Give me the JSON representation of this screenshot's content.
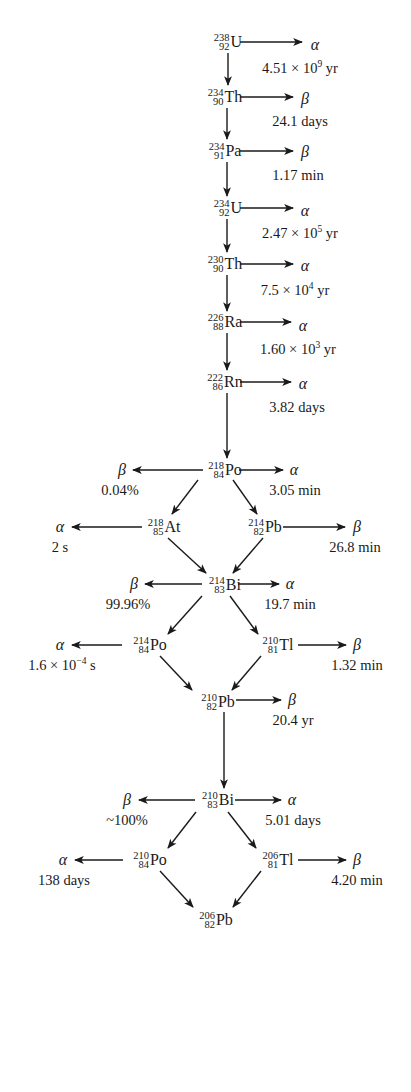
{
  "colors": {
    "ink": "#1a1a1a",
    "background": "#ffffff"
  },
  "nuclides": [
    {
      "id": "U238",
      "mass": "238",
      "number": "92",
      "symbol": "U",
      "x": 228,
      "y": 42
    },
    {
      "id": "Th234",
      "mass": "234",
      "number": "90",
      "symbol": "Th",
      "x": 225,
      "y": 97
    },
    {
      "id": "Pa234",
      "mass": "234",
      "number": "91",
      "symbol": "Pa",
      "x": 225,
      "y": 151
    },
    {
      "id": "U234",
      "mass": "234",
      "number": "92",
      "symbol": "U",
      "x": 228,
      "y": 208
    },
    {
      "id": "Th230",
      "mass": "230",
      "number": "90",
      "symbol": "Th",
      "x": 225,
      "y": 264
    },
    {
      "id": "Ra226",
      "mass": "226",
      "number": "88",
      "symbol": "Ra",
      "x": 225,
      "y": 322
    },
    {
      "id": "Rn222",
      "mass": "222",
      "number": "86",
      "symbol": "Rn",
      "x": 225,
      "y": 382
    },
    {
      "id": "Po218",
      "mass": "218",
      "number": "84",
      "symbol": "Po",
      "x": 225,
      "y": 470
    },
    {
      "id": "At218",
      "mass": "218",
      "number": "85",
      "symbol": "At",
      "x": 164,
      "y": 527
    },
    {
      "id": "Pb214",
      "mass": "214",
      "number": "82",
      "symbol": "Pb",
      "x": 265,
      "y": 527
    },
    {
      "id": "Bi214",
      "mass": "214",
      "number": "83",
      "symbol": "Bi",
      "x": 225,
      "y": 585
    },
    {
      "id": "Po214",
      "mass": "214",
      "number": "84",
      "symbol": "Po",
      "x": 150,
      "y": 645
    },
    {
      "id": "Tl210",
      "mass": "210",
      "number": "81",
      "symbol": "Tl",
      "x": 278,
      "y": 645
    },
    {
      "id": "Pb210",
      "mass": "210",
      "number": "82",
      "symbol": "Pb",
      "x": 218,
      "y": 702
    },
    {
      "id": "Bi210",
      "mass": "210",
      "number": "83",
      "symbol": "Bi",
      "x": 218,
      "y": 800
    },
    {
      "id": "Po210",
      "mass": "210",
      "number": "84",
      "symbol": "Po",
      "x": 150,
      "y": 860
    },
    {
      "id": "Tl206",
      "mass": "206",
      "number": "81",
      "symbol": "Tl",
      "x": 278,
      "y": 860
    },
    {
      "id": "Pb206",
      "mass": "206",
      "number": "82",
      "symbol": "Pb",
      "x": 216,
      "y": 920
    }
  ],
  "decay_modes": [
    {
      "parent": "U238",
      "mode": "α",
      "x": 315,
      "y": 45,
      "label": "4.51 × 10",
      "label_sup": "9",
      "label_tail": " yr",
      "lx": 300,
      "ly": 68
    },
    {
      "parent": "Th234",
      "mode": "β",
      "x": 305,
      "y": 99,
      "label": "24.1 days",
      "lx": 300,
      "ly": 121
    },
    {
      "parent": "Pa234",
      "mode": "β",
      "x": 305,
      "y": 152,
      "label": "1.17 min",
      "lx": 298,
      "ly": 175
    },
    {
      "parent": "U234",
      "mode": "α",
      "x": 305,
      "y": 211,
      "label": "2.47 × 10",
      "label_sup": "5",
      "label_tail": " yr",
      "lx": 300,
      "ly": 233
    },
    {
      "parent": "Th230",
      "mode": "α",
      "x": 305,
      "y": 266,
      "label": "7.5 × 10",
      "label_sup": "4",
      "label_tail": " yr",
      "lx": 295,
      "ly": 290
    },
    {
      "parent": "Ra226",
      "mode": "α",
      "x": 303,
      "y": 326,
      "label": "1.60 × 10",
      "label_sup": "3",
      "label_tail": " yr",
      "lx": 298,
      "ly": 349
    },
    {
      "parent": "Rn222",
      "mode": "α",
      "x": 303,
      "y": 384,
      "label": "3.82 days",
      "lx": 297,
      "ly": 407
    },
    {
      "parent": "Po218",
      "mode": "β",
      "x": 122,
      "y": 470,
      "label": "0.04%",
      "lx": 120,
      "ly": 490
    },
    {
      "parent": "Po218",
      "mode": "α",
      "x": 294,
      "y": 470,
      "label": "3.05 min",
      "lx": 295,
      "ly": 490
    },
    {
      "parent": "At218",
      "mode": "α",
      "x": 60,
      "y": 527,
      "label": "2 s",
      "lx": 60,
      "ly": 547
    },
    {
      "parent": "Pb214",
      "mode": "β",
      "x": 357,
      "y": 527,
      "label": "26.8 min",
      "lx": 355,
      "ly": 547
    },
    {
      "parent": "Bi214",
      "mode": "β",
      "x": 134,
      "y": 584,
      "label": "99.96%",
      "lx": 128,
      "ly": 604
    },
    {
      "parent": "Bi214",
      "mode": "α",
      "x": 290,
      "y": 584,
      "label": "19.7 min",
      "lx": 290,
      "ly": 604
    },
    {
      "parent": "Po214",
      "mode": "α",
      "x": 60,
      "y": 645,
      "label": "1.6 × 10",
      "label_sup": "−4",
      "label_tail": " s",
      "lx": 62,
      "ly": 665
    },
    {
      "parent": "Tl210",
      "mode": "β",
      "x": 357,
      "y": 645,
      "label": "1.32 min",
      "lx": 357,
      "ly": 665
    },
    {
      "parent": "Pb210",
      "mode": "β",
      "x": 292,
      "y": 700,
      "label": "20.4 yr",
      "lx": 293,
      "ly": 720
    },
    {
      "parent": "Bi210",
      "mode": "β",
      "x": 127,
      "y": 800,
      "label": "~100%",
      "lx": 127,
      "ly": 820
    },
    {
      "parent": "Bi210",
      "mode": "α",
      "x": 292,
      "y": 800,
      "label": "5.01 days",
      "lx": 293,
      "ly": 820
    },
    {
      "parent": "Po210",
      "mode": "α",
      "x": 63,
      "y": 860,
      "label": "138 days",
      "lx": 64,
      "ly": 880
    },
    {
      "parent": "Tl206",
      "mode": "β",
      "x": 357,
      "y": 860,
      "label": "4.20 min",
      "lx": 357,
      "ly": 880
    }
  ],
  "arrows": [
    {
      "x1": 240,
      "y1": 42,
      "x2": 302,
      "y2": 42
    },
    {
      "x1": 228,
      "y1": 53,
      "x2": 228,
      "y2": 85
    },
    {
      "x1": 240,
      "y1": 97,
      "x2": 293,
      "y2": 97
    },
    {
      "x1": 227,
      "y1": 108,
      "x2": 227,
      "y2": 139
    },
    {
      "x1": 240,
      "y1": 151,
      "x2": 293,
      "y2": 151
    },
    {
      "x1": 227,
      "y1": 162,
      "x2": 227,
      "y2": 196
    },
    {
      "x1": 240,
      "y1": 208,
      "x2": 293,
      "y2": 208
    },
    {
      "x1": 227,
      "y1": 219,
      "x2": 227,
      "y2": 252
    },
    {
      "x1": 240,
      "y1": 264,
      "x2": 293,
      "y2": 264
    },
    {
      "x1": 227,
      "y1": 275,
      "x2": 227,
      "y2": 311
    },
    {
      "x1": 240,
      "y1": 322,
      "x2": 291,
      "y2": 322
    },
    {
      "x1": 227,
      "y1": 333,
      "x2": 227,
      "y2": 370
    },
    {
      "x1": 240,
      "y1": 382,
      "x2": 291,
      "y2": 382
    },
    {
      "x1": 227,
      "y1": 393,
      "x2": 227,
      "y2": 458
    },
    {
      "x1": 203,
      "y1": 470,
      "x2": 133,
      "y2": 470
    },
    {
      "x1": 239,
      "y1": 470,
      "x2": 283,
      "y2": 470
    },
    {
      "x1": 198,
      "y1": 480,
      "x2": 172,
      "y2": 514
    },
    {
      "x1": 233,
      "y1": 480,
      "x2": 257,
      "y2": 514
    },
    {
      "x1": 142,
      "y1": 527,
      "x2": 72,
      "y2": 527
    },
    {
      "x1": 283,
      "y1": 527,
      "x2": 345,
      "y2": 527
    },
    {
      "x1": 168,
      "y1": 538,
      "x2": 206,
      "y2": 573
    },
    {
      "x1": 263,
      "y1": 538,
      "x2": 233,
      "y2": 573
    },
    {
      "x1": 202,
      "y1": 584,
      "x2": 145,
      "y2": 584
    },
    {
      "x1": 238,
      "y1": 584,
      "x2": 279,
      "y2": 584
    },
    {
      "x1": 202,
      "y1": 596,
      "x2": 168,
      "y2": 634
    },
    {
      "x1": 230,
      "y1": 596,
      "x2": 258,
      "y2": 634
    },
    {
      "x1": 122,
      "y1": 645,
      "x2": 72,
      "y2": 645
    },
    {
      "x1": 298,
      "y1": 645,
      "x2": 346,
      "y2": 645
    },
    {
      "x1": 160,
      "y1": 656,
      "x2": 192,
      "y2": 690
    },
    {
      "x1": 261,
      "y1": 656,
      "x2": 232,
      "y2": 690
    },
    {
      "x1": 236,
      "y1": 700,
      "x2": 281,
      "y2": 700
    },
    {
      "x1": 224,
      "y1": 712,
      "x2": 224,
      "y2": 788
    },
    {
      "x1": 195,
      "y1": 800,
      "x2": 139,
      "y2": 800
    },
    {
      "x1": 235,
      "y1": 800,
      "x2": 281,
      "y2": 800
    },
    {
      "x1": 196,
      "y1": 812,
      "x2": 168,
      "y2": 848
    },
    {
      "x1": 228,
      "y1": 812,
      "x2": 256,
      "y2": 848
    },
    {
      "x1": 123,
      "y1": 860,
      "x2": 75,
      "y2": 860
    },
    {
      "x1": 298,
      "y1": 860,
      "x2": 346,
      "y2": 860
    },
    {
      "x1": 160,
      "y1": 871,
      "x2": 193,
      "y2": 907
    },
    {
      "x1": 261,
      "y1": 871,
      "x2": 233,
      "y2": 907
    }
  ]
}
